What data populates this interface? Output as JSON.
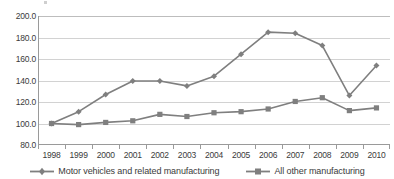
{
  "chart_data": {
    "type": "line",
    "title": "",
    "xlabel": "",
    "ylabel": "",
    "categories": [
      "1998",
      "1999",
      "2000",
      "2001",
      "2002",
      "2003",
      "2004",
      "2005",
      "2006",
      "2007",
      "2008",
      "2009",
      "2010"
    ],
    "ylim": [
      80.0,
      200.0
    ],
    "yticks": [
      "80.0",
      "100.0",
      "120.0",
      "140.0",
      "160.0",
      "180.0",
      "200.0"
    ],
    "ytick_values": [
      80.0,
      100.0,
      120.0,
      140.0,
      160.0,
      180.0,
      200.0
    ],
    "grid": true,
    "legend_position": "bottom",
    "series": [
      {
        "name": "Motor vehicles and related manufacturing",
        "marker": "diamond",
        "color": "#7f7f7f",
        "values": [
          100.0,
          111.0,
          127.0,
          139.5,
          139.5,
          135.0,
          144.0,
          164.5,
          185.0,
          184.0,
          172.5,
          126.0,
          154.0
        ]
      },
      {
        "name": "All other manufacturing",
        "marker": "square",
        "color": "#7f7f7f",
        "values": [
          100.0,
          99.0,
          101.0,
          102.5,
          108.5,
          106.5,
          110.0,
          111.0,
          113.5,
          120.5,
          124.0,
          112.0,
          114.5
        ]
      }
    ]
  },
  "style": {
    "gridline_color": "#d2d2d2",
    "axis_color": "#9a9a9a",
    "text_color": "#3b3b3b",
    "background": "#ffffff"
  }
}
